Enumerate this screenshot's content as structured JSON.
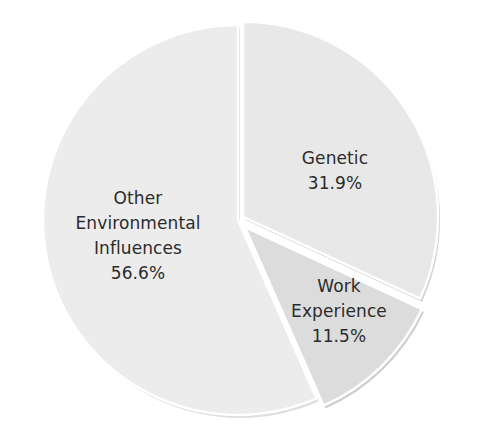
{
  "chart_data": {
    "type": "pie",
    "title": "",
    "categories": [
      "Genetic",
      "Work Experience",
      "Other Environmental Influences"
    ],
    "values": [
      31.9,
      11.5,
      56.6
    ],
    "unit": "%",
    "start_angle_deg": 0,
    "direction": "clockwise",
    "exploded": true,
    "slices": [
      {
        "name": "Genetic",
        "value": 31.9,
        "label_lines": [
          "Genetic",
          "31.9%"
        ],
        "color": "#e8e8e8",
        "edge_color": "#d2d2d2",
        "offset": 6
      },
      {
        "name": "Work Experience",
        "value": 11.5,
        "label_lines": [
          "Work",
          "Experience",
          "11.5%"
        ],
        "color": "#dcdcdc",
        "edge_color": "#cfcfcf",
        "offset": 10
      },
      {
        "name": "Other Environmental Influences",
        "value": 56.6,
        "label_lines": [
          "Other",
          "Environmental",
          "Influences",
          "56.6%"
        ],
        "color": "#ececec",
        "edge_color": "#dedede",
        "offset": 0
      }
    ],
    "legend": "none (labels inside slices)"
  },
  "labels": {
    "genetic": {
      "line1": "Genetic",
      "line2": "31.9%"
    },
    "work": {
      "line1": "Work",
      "line2": "Experience",
      "line3": "11.5%"
    },
    "other": {
      "line1": "Other",
      "line2": "Environmental",
      "line3": "Influences",
      "line4": "56.6%"
    }
  },
  "colors": {
    "background": "#ffffff",
    "text": "#2b2b2b",
    "separator": "#ffffff"
  }
}
